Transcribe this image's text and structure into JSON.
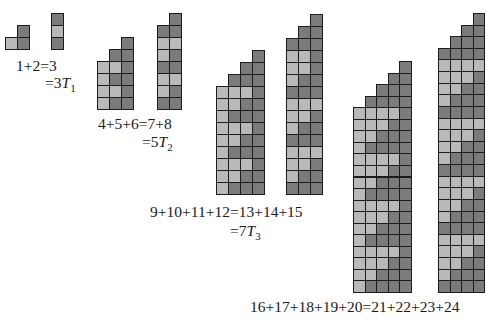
{
  "figure": {
    "colors": {
      "light": "#b9b9b9",
      "dark": "#7b7b7b",
      "border": "#1c1c1c"
    },
    "groups": [
      {
        "id": "n1",
        "blocks": [
          {
            "name": "staircase-1",
            "x": 5,
            "y": 25,
            "cell": 12,
            "rows": [
              ".D",
              "LD"
            ]
          },
          {
            "name": "column-1",
            "x": 51,
            "y": 13,
            "cell": 12,
            "rows": [
              "D",
              "L",
              "D"
            ]
          }
        ],
        "equation": {
          "text": "1+2=3",
          "x": 16,
          "y": 57
        },
        "identity": {
          "prefix": "=3",
          "var": "T",
          "sub": "1",
          "x": 45,
          "y": 74
        }
      },
      {
        "id": "n2",
        "blocks": [
          {
            "name": "staircase-2",
            "x": 97,
            "y": 37,
            "cell": 12,
            "rows": [
              "..D",
              ".DD",
              "LLD",
              "LDD",
              "LLD",
              "LDD"
            ]
          },
          {
            "name": "column-2",
            "x": 157,
            "y": 13,
            "cell": 12,
            "rows": [
              ".D",
              "DD",
              "LL",
              "LD",
              "DD",
              "LL",
              "LD",
              "DD"
            ]
          }
        ],
        "equation": {
          "text": "4+5+6=7+8",
          "x": 98,
          "y": 115
        },
        "identity": {
          "prefix": "=5",
          "var": "T",
          "sub": "2",
          "x": 142,
          "y": 133
        }
      },
      {
        "id": "n3",
        "blocks": [
          {
            "name": "staircase-3",
            "x": 216,
            "y": 50,
            "cell": 12,
            "rows": [
              "...D",
              "..DD",
              ".DDD",
              "LLLD",
              "LLDD",
              "LDDD",
              "LLLD",
              "LLDD",
              "LDDD",
              "LLLD",
              "LLDD",
              "LDDD"
            ]
          },
          {
            "name": "column-3",
            "x": 286,
            "y": 14,
            "cell": 12,
            "rows": [
              "..D",
              ".DD",
              "DDD",
              "LLD",
              "LLD",
              "LDD",
              "DDD",
              "LLL",
              "LLD",
              "LDD",
              "DDD",
              "LLL",
              "LLD",
              "LDD",
              "DDD"
            ]
          }
        ],
        "equation": {
          "text": "9+10+11+12=13+14+15",
          "x": 150,
          "y": 203
        },
        "identity": {
          "prefix": "=7",
          "var": "T",
          "sub": "3",
          "x": 230,
          "y": 222
        }
      },
      {
        "id": "n4",
        "blocks": [
          {
            "name": "staircase-4",
            "x": 353,
            "y": 61,
            "cell": 11.55,
            "rows": [
              "....D",
              "...DD",
              "..DDD",
              ".DDDD",
              "LLLLD",
              "LLLDD",
              "LLDDD",
              "LDDDD",
              "LLLLD",
              "LLLDD",
              "LLDDD",
              "LDDDD",
              "LLLLD",
              "LLLDD",
              "LLDDD",
              "LDDDD",
              "LLLLD",
              "LLLDD",
              "LLDDD",
              "LDDDD"
            ]
          },
          {
            "name": "column-4",
            "x": 438,
            "y": 13,
            "cell": 11.62,
            "rows": [
              "...D",
              "..DD",
              ".DDD",
              "DDDD",
              "LLLL",
              "LLLD",
              "LLDD",
              "LDDD",
              "DDDD",
              "LLLL",
              "LLLD",
              "LLDD",
              "LDDD",
              "DDDD",
              "LLLL",
              "LLLD",
              "LLDD",
              "LDDD",
              "DDDD",
              "LLLL",
              "LLLD",
              "LLDD",
              "LDDD",
              "DDDD"
            ]
          }
        ],
        "equation": {
          "text": "16+17+18+19+20=21+22+23+24",
          "x": 250,
          "y": 298
        },
        "identity": null
      }
    ]
  }
}
